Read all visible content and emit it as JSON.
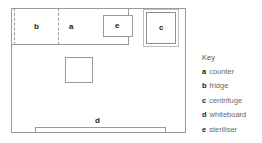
{
  "diagram": {
    "room": {
      "name": "room-outline"
    },
    "items": [
      {
        "id": "a",
        "label": "a",
        "name": "counter",
        "style": "solid-band"
      },
      {
        "id": "b",
        "label": "b",
        "name": "fridge",
        "style": "dashed-box"
      },
      {
        "id": "c",
        "label": "c",
        "name": "centrifuge",
        "style": "double-box"
      },
      {
        "id": "d",
        "label": "d",
        "name": "whiteboard",
        "style": "thin-bar"
      },
      {
        "id": "e",
        "label": "e",
        "name": "steriliser",
        "style": "solid-box"
      }
    ],
    "unlabelled_object": ""
  },
  "key": {
    "title": "Key",
    "entries": [
      {
        "letter": "a",
        "text": "counter"
      },
      {
        "letter": "b",
        "text": "fridge"
      },
      {
        "letter": "c",
        "text": "centrifuge"
      },
      {
        "letter": "d",
        "text": "whiteboard"
      },
      {
        "letter": "e",
        "text": "steriliser"
      }
    ]
  },
  "colors": {
    "line": "#9a9a9a",
    "label": "#1a1a1a",
    "key_text": "#6b6b6b",
    "background": "#ffffff"
  }
}
